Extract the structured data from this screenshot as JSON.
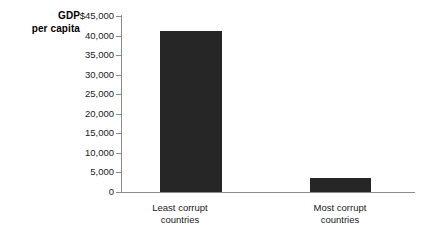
{
  "chart_data": {
    "type": "bar",
    "title": "",
    "xlabel": "",
    "ylabel": "GDP per capita",
    "ylabel_lines": [
      "GDP",
      "per capita"
    ],
    "categories": [
      "Least corrupt countries",
      "Most corrupt countries"
    ],
    "category_lines": [
      [
        "Least corrupt",
        "countries"
      ],
      [
        "Most corrupt",
        "countries"
      ]
    ],
    "values": [
      41200,
      3600
    ],
    "ylim": [
      0,
      45000
    ],
    "ytick_values": [
      45000,
      40000,
      35000,
      30000,
      25000,
      20000,
      15000,
      10000,
      5000,
      0
    ],
    "ytick_labels": [
      "$45,000",
      "40,000",
      "35,000",
      "30,000",
      "25,000",
      "20,000",
      "15,000",
      "10,000",
      "5,000",
      "0"
    ],
    "grid": false,
    "legend": null,
    "bar_color": "#262626",
    "axis_color": "#8a8a8a",
    "background": "#ffffff"
  }
}
